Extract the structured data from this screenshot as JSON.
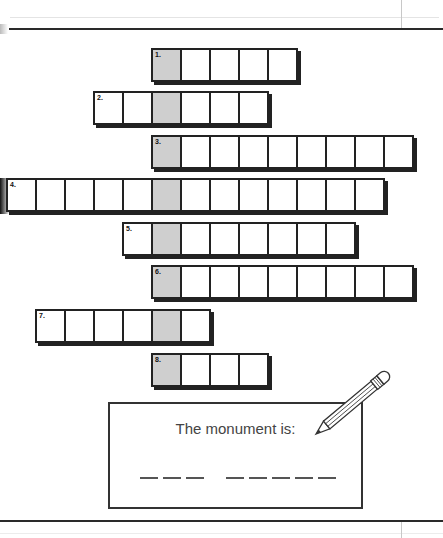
{
  "puzzle": {
    "rows": [
      {
        "number": "1.",
        "left": 151,
        "top": 48,
        "cells": 5,
        "shaded_index": 0
      },
      {
        "number": "2.",
        "left": 93,
        "top": 91,
        "cells": 6,
        "shaded_index": 2
      },
      {
        "number": "3.",
        "left": 151,
        "top": 135,
        "cells": 9,
        "shaded_index": 0
      },
      {
        "number": "4.",
        "left": 6,
        "top": 178,
        "cells": 13,
        "shaded_index": 5
      },
      {
        "number": "5.",
        "left": 122,
        "top": 222,
        "cells": 8,
        "shaded_index": 1
      },
      {
        "number": "6.",
        "left": 151,
        "top": 265,
        "cells": 9,
        "shaded_index": 0
      },
      {
        "number": "7.",
        "left": 35,
        "top": 309,
        "cells": 6,
        "shaded_index": 4
      },
      {
        "number": "8.",
        "left": 151,
        "top": 353,
        "cells": 4,
        "shaded_index": 0
      }
    ]
  },
  "answer": {
    "label": "The monument is:",
    "words": [
      3,
      5
    ]
  },
  "icons": {
    "pencil": "pencil-icon"
  }
}
